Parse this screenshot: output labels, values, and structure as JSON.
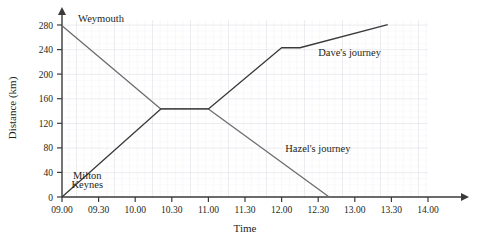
{
  "chart_data": {
    "type": "line",
    "title": "",
    "xlabel": "Time",
    "ylabel": "Distance (km)",
    "grid": true,
    "legend_position": "inline-annotations",
    "xlim": [
      9.0,
      14.0
    ],
    "ylim": [
      0,
      300
    ],
    "x_tick_labels": [
      "09.00",
      "09.30",
      "10.00",
      "10.30",
      "11.00",
      "11.30",
      "12.00",
      "12.30",
      "13.00",
      "13.30",
      "14.00"
    ],
    "x_tick_values": [
      9.0,
      9.5,
      10.0,
      10.5,
      11.0,
      11.5,
      12.0,
      12.5,
      13.0,
      13.5,
      14.0
    ],
    "y_tick_labels": [
      "0",
      "40",
      "80",
      "120",
      "160",
      "200",
      "240",
      "280"
    ],
    "y_tick_values": [
      0,
      40,
      80,
      120,
      160,
      200,
      240,
      280
    ],
    "series": [
      {
        "name": "Hazel's journey",
        "label": "Hazel's journey",
        "label_x": 12.05,
        "label_y": 74,
        "color": "#6d6d6d",
        "points": [
          {
            "x": 9.0,
            "y": 280
          },
          {
            "x": 10.35,
            "y": 144
          },
          {
            "x": 11.0,
            "y": 144
          },
          {
            "x": 12.65,
            "y": 0
          }
        ]
      },
      {
        "name": "Dave's journey",
        "label": "Dave's journey",
        "label_x": 12.5,
        "label_y": 230,
        "color": "#3a3a3a",
        "points": [
          {
            "x": 9.0,
            "y": 0
          },
          {
            "x": 10.35,
            "y": 144
          },
          {
            "x": 11.0,
            "y": 144
          },
          {
            "x": 12.0,
            "y": 244
          },
          {
            "x": 12.25,
            "y": 244
          },
          {
            "x": 13.45,
            "y": 282
          }
        ]
      }
    ],
    "annotations": [
      {
        "name": "weymouth",
        "text": "Weymouth",
        "x": 9.22,
        "y": 286
      },
      {
        "name": "milton-keynes-line1",
        "text": "Milton",
        "x": 9.15,
        "y": 30
      },
      {
        "name": "milton-keynes-line2",
        "text": "Keynes",
        "x": 9.13,
        "y": 14
      }
    ]
  }
}
